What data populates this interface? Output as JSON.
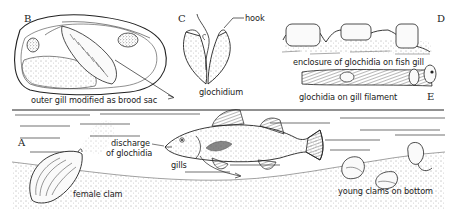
{
  "figure": {
    "panels": {
      "A": {
        "letter": "A",
        "labels": {
          "discharge": [
            "discharge",
            "of glochidia"
          ],
          "gills": "gills",
          "female_clam": "female clam",
          "young_clams": "young clams on bottom"
        }
      },
      "B": {
        "letter": "B",
        "labels": {
          "brood_sac": "outer gill modified as brood sac"
        }
      },
      "C": {
        "letter": "C",
        "labels": {
          "hook": "hook",
          "caption": "glochidium"
        }
      },
      "D": {
        "letter": "D",
        "labels": {
          "caption": "enclosure of glochidia on fish gill"
        }
      },
      "E": {
        "letter": "E",
        "labels": {
          "caption": "glochidia on gill filament"
        }
      }
    },
    "colors": {
      "ink": "#1a1a1a",
      "background": "#ffffff",
      "stipple": "#555555"
    }
  }
}
